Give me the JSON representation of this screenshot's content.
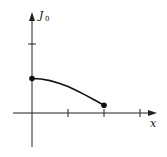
{
  "chart_data": {
    "type": "line",
    "title": "",
    "xlabel": "x",
    "ylabel": "J",
    "ylabel_subscript": "0",
    "x": [
      0,
      0.25,
      0.5,
      0.75,
      1.0,
      1.25,
      1.5,
      1.75,
      2.0
    ],
    "series": [
      {
        "name": "J0(x)",
        "values": [
          1.0,
          0.984,
          0.938,
          0.864,
          0.765,
          0.646,
          0.512,
          0.369,
          0.224
        ]
      }
    ],
    "endpoints": [
      {
        "x": 0,
        "y": 1.0,
        "marker": "filled-circle"
      },
      {
        "x": 2,
        "y": 0.224,
        "marker": "filled-circle"
      }
    ],
    "x_ticks": [
      1,
      2,
      3
    ],
    "y_ticks": [
      2
    ],
    "xlim": [
      -0.55,
      3.5
    ],
    "ylim": [
      -1.0,
      2.9
    ],
    "grid": false,
    "legend": "none",
    "colors": {
      "line": "#111111",
      "axes": "#222222"
    }
  }
}
